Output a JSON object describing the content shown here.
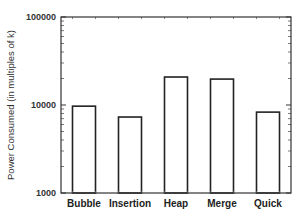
{
  "chart_data": {
    "type": "bar",
    "title": "",
    "xlabel": "",
    "ylabel": "Power Consumed (in multiples of k)",
    "yscale": "log",
    "ylim": [
      1000,
      100000
    ],
    "yticks": [
      1000,
      10000,
      100000
    ],
    "ytick_labels": [
      "1000",
      "10000",
      "100000"
    ],
    "categories": [
      "Bubble",
      "Insertion",
      "Heap",
      "Merge",
      "Quick"
    ],
    "values": [
      9700,
      7300,
      20800,
      19700,
      8300
    ],
    "bar_fill": "#ffffff",
    "bar_edge": "#222222",
    "grid": false,
    "legend": null
  }
}
